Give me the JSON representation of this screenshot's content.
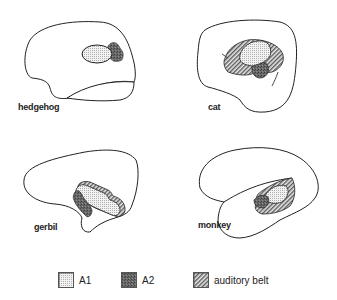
{
  "figure": {
    "panels": [
      {
        "id": "hedgehog",
        "label": "hedgehog",
        "regions": [
          "A1",
          "A2"
        ]
      },
      {
        "id": "cat",
        "label": "cat",
        "regions": [
          "A1",
          "A2",
          "auditory belt"
        ]
      },
      {
        "id": "gerbil",
        "label": "gerbil",
        "regions": [
          "A1",
          "A2",
          "auditory belt"
        ]
      },
      {
        "id": "monkey",
        "label": "monkey",
        "regions": [
          "A1",
          "A2",
          "auditory belt"
        ]
      }
    ]
  },
  "legend": {
    "items": [
      {
        "key": "A1",
        "label": "A1",
        "pattern": "fine-dots",
        "color": "#e6e6e6"
      },
      {
        "key": "A2",
        "label": "A2",
        "pattern": "dark-stipple",
        "color": "#5a5a5a"
      },
      {
        "key": "belt",
        "label": "auditory belt",
        "pattern": "diagonal-hatch",
        "color": "#9a9a9a"
      }
    ]
  },
  "colors": {
    "outline": "#222222",
    "background": "#ffffff"
  }
}
